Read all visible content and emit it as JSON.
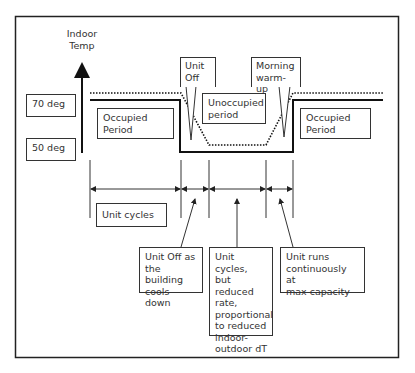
{
  "diagram": {
    "y_axis_label": "Indoor\nTemp",
    "levels": [
      {
        "label": "70 deg"
      },
      {
        "label": "50 deg"
      }
    ],
    "period_labels": {
      "occupied_left": "Occupied\nPeriod",
      "unoccupied": "Unoccupied\nperiod",
      "occupied_right": "Occupied\nPeriod"
    },
    "callouts": {
      "unit_off": "Unit\nOff",
      "morning_warmup": "Morning\nwarm-up"
    },
    "intervals": {
      "unit_cycles": "Unit cycles"
    },
    "notes": [
      {
        "text": "Unit Off as\nthe building\ncools down"
      },
      {
        "text": "Unit cycles,\nbut reduced\nrate,\nproportional\nto reduced\nindoor-\noutdoor dT"
      },
      {
        "text": "Unit runs\ncontinuously at\nmax capacity"
      }
    ],
    "series": [
      {
        "name": "setpoint",
        "style": "solid"
      },
      {
        "name": "indoor-temperature",
        "style": "dotted"
      }
    ],
    "colors": {
      "line": "#111111",
      "box_border": "#333333",
      "background": "#ffffff"
    }
  }
}
